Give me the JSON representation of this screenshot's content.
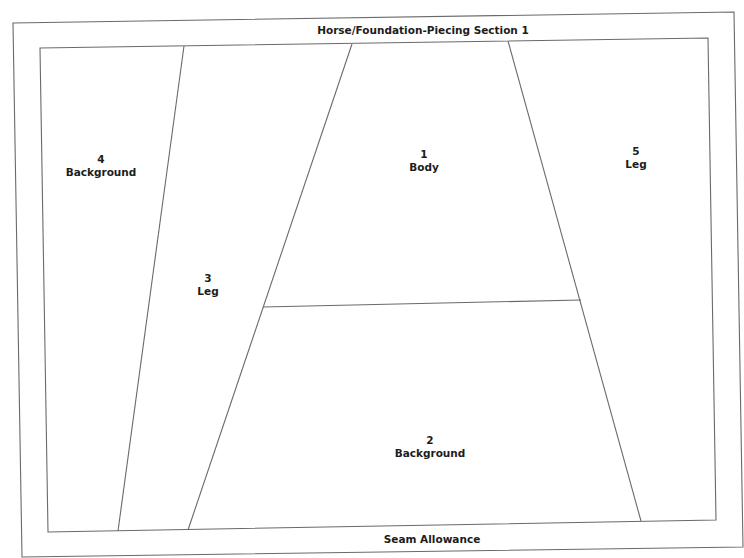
{
  "diagram": {
    "title": "Horse/Foundation-Piecing Section 1",
    "footer": "Seam Allowance",
    "stroke_color": "#6a6a6a",
    "text_color": "#1c1c1c",
    "sections": [
      {
        "number": "1",
        "name": "Body"
      },
      {
        "number": "2",
        "name": "Background"
      },
      {
        "number": "3",
        "name": "Leg"
      },
      {
        "number": "4",
        "name": "Background"
      },
      {
        "number": "5",
        "name": "Leg"
      }
    ]
  }
}
